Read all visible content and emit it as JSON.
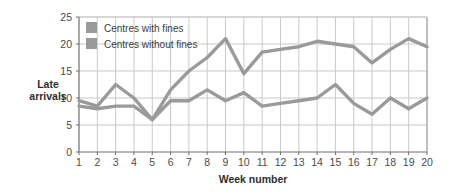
{
  "chart_data": {
    "type": "line",
    "title": "",
    "xlabel": "Week number",
    "ylabel": "Late arrivals",
    "ylabel_lines": [
      "Late",
      "arrivals"
    ],
    "xlim": [
      1,
      20
    ],
    "ylim": [
      0,
      25
    ],
    "ytick_values": [
      0,
      5,
      10,
      15,
      20,
      25
    ],
    "yticks": [
      "0",
      "5",
      "10",
      "15",
      "20",
      "25"
    ],
    "x": [
      1,
      2,
      3,
      4,
      5,
      6,
      7,
      8,
      9,
      10,
      11,
      12,
      13,
      14,
      15,
      16,
      17,
      18,
      19,
      20
    ],
    "xticks": [
      "1",
      "2",
      "3",
      "4",
      "5",
      "6",
      "7",
      "8",
      "9",
      "10",
      "11",
      "12",
      "13",
      "14",
      "15",
      "16",
      "17",
      "18",
      "19",
      "20"
    ],
    "grid": true,
    "legend_position": "top-left-inside",
    "series": [
      {
        "name": "Centres with fines",
        "color": "#9a9a9a",
        "values": [
          9.5,
          8.5,
          12.5,
          10,
          6,
          11.5,
          15,
          17.5,
          21,
          14.5,
          18.5,
          19,
          19.5,
          20.5,
          20,
          19.5,
          16.5,
          19,
          21,
          19.5
        ]
      },
      {
        "name": "Centres without fines",
        "color": "#9a9a9a",
        "values": [
          8.5,
          8,
          8.5,
          8.5,
          6,
          9.5,
          9.5,
          11.5,
          9.5,
          11,
          8.5,
          9,
          9.5,
          10,
          12.5,
          9,
          7,
          10,
          8,
          10
        ]
      }
    ]
  },
  "legend": {
    "items": [
      {
        "label": "Centres with fines",
        "swatch_color": "#9a9a9a"
      },
      {
        "label": "Centres without fines",
        "swatch_color": "#9a9a9a"
      }
    ]
  },
  "axes": {
    "x_title": "Week number",
    "y_title_line1": "Late",
    "y_title_line2": "arrivals"
  },
  "colors": {
    "line": "#9a9a9a",
    "grid": "#c9c9c9",
    "frame": "#6e6e6e",
    "text": "#3a3a3a",
    "background": "#ffffff"
  }
}
